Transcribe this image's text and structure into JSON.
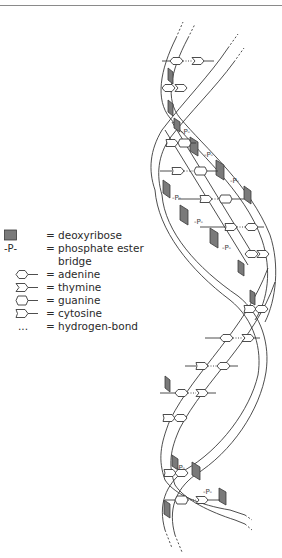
{
  "diagram": {
    "colors": {
      "line": "#3a3a3a",
      "deoxyribose_fill": "#7a7a7a",
      "background": "#ffffff"
    }
  },
  "legend": {
    "items": [
      {
        "symbol": "deoxyribose-box",
        "equals": "=",
        "label": "deoxyribose"
      },
      {
        "symbol": "-P-",
        "equals": "=",
        "label": "phosphate ester"
      },
      {
        "symbol": "",
        "equals": "",
        "label": "bridge"
      },
      {
        "symbol": "adenine-shape",
        "equals": "=",
        "label": "adenine"
      },
      {
        "symbol": "thymine-shape",
        "equals": "=",
        "label": "thymine"
      },
      {
        "symbol": "guanine-shape",
        "equals": "=",
        "label": "guanine"
      },
      {
        "symbol": "cytosine-shape",
        "equals": "=",
        "label": "cytosine"
      },
      {
        "symbol": "...",
        "equals": "=",
        "label": "hydrogen-bond"
      }
    ]
  },
  "helix": {
    "phosphate_label": "P"
  }
}
